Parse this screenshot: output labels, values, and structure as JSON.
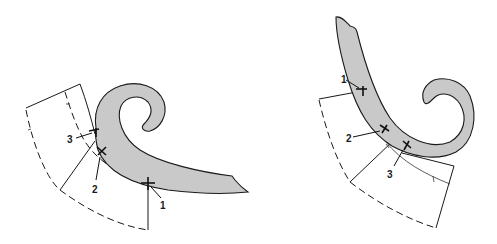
{
  "diagram": {
    "colors": {
      "curve_fill": "#c9c9c9",
      "line": "#1a1a1a",
      "background": "#ffffff"
    },
    "figures": [
      {
        "id": "left",
        "labels": [
          {
            "text": "3"
          },
          {
            "text": "2"
          },
          {
            "text": "1"
          }
        ]
      },
      {
        "id": "right",
        "labels": [
          {
            "text": "1"
          },
          {
            "text": "2"
          },
          {
            "text": "3"
          }
        ]
      }
    ]
  }
}
